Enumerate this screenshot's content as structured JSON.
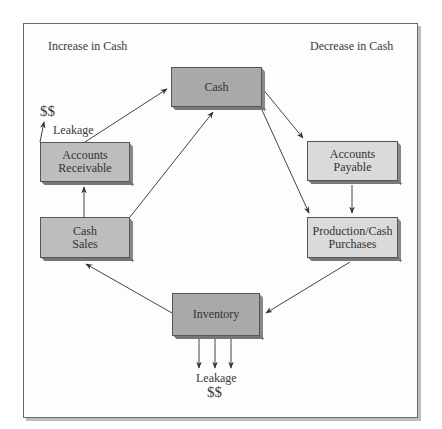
{
  "diagram": {
    "region_labels": {
      "left": "Increase in Cash",
      "right": "Decrease in Cash"
    },
    "nodes": {
      "cash": {
        "label": "Cash",
        "fill": "#a9a9a9"
      },
      "accounts_receivable": {
        "line1": "Accounts",
        "line2": "Receivable",
        "fill": "#bdbdbd"
      },
      "cash_sales": {
        "line1": "Cash",
        "line2": "Sales",
        "fill": "#bdbdbd"
      },
      "accounts_payable": {
        "line1": "Accounts",
        "line2": "Payable",
        "fill": "#dadada"
      },
      "production": {
        "line1": "Production/Cash",
        "line2": "Purchases",
        "fill": "#dadada"
      },
      "inventory": {
        "label": "Inventory",
        "fill": "#a9a9a9"
      }
    },
    "leakage_top": {
      "label": "Leakage",
      "amount": "$$"
    },
    "leakage_bottom": {
      "label": "Leakage",
      "amount": "$$"
    },
    "edges": [
      {
        "from": "Accounts Receivable",
        "to": "Cash"
      },
      {
        "from": "Cash Sales",
        "to": "Cash"
      },
      {
        "from": "Cash Sales",
        "to": "Accounts Receivable"
      },
      {
        "from": "Cash",
        "to": "Accounts Payable"
      },
      {
        "from": "Cash",
        "to": "Production/Cash Purchases"
      },
      {
        "from": "Accounts Payable",
        "to": "Production/Cash Purchases"
      },
      {
        "from": "Production/Cash Purchases",
        "to": "Inventory"
      },
      {
        "from": "Inventory",
        "to": "Cash Sales"
      },
      {
        "from": "Accounts Receivable",
        "to": "Leakage $$"
      },
      {
        "from": "Inventory",
        "to": "Leakage $$"
      }
    ]
  }
}
